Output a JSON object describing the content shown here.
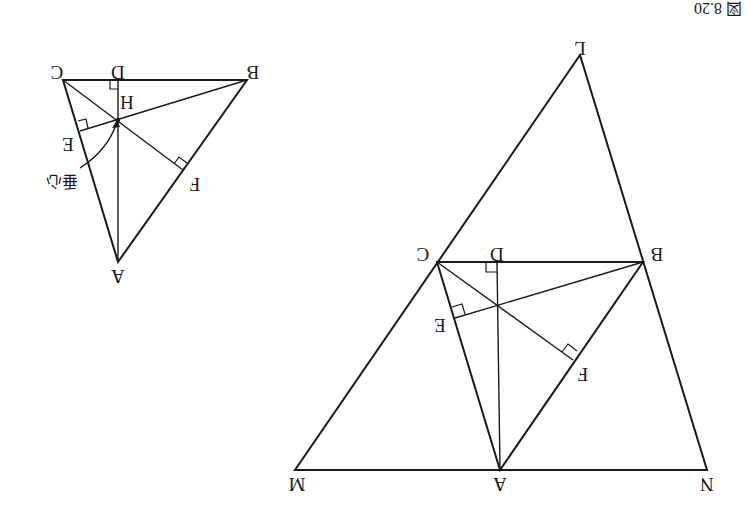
{
  "figure": {
    "caption": "図 8.20",
    "orientation": "rotated 180 degrees",
    "annotation_label": "垂心"
  },
  "large_figure": {
    "outer_triangle": [
      "L",
      "M",
      "N"
    ],
    "inner_triangle": [
      "A",
      "B",
      "C"
    ],
    "altitude_feet": [
      "D",
      "E",
      "F"
    ],
    "labels": {
      "L": "L",
      "M": "M",
      "N": "N",
      "A": "A",
      "B": "B",
      "C": "C",
      "D": "D",
      "E": "E",
      "F": "F"
    },
    "right_angle_marks": [
      "D",
      "E",
      "F"
    ]
  },
  "small_figure": {
    "triangle": [
      "A",
      "B",
      "C"
    ],
    "altitude_feet": [
      "D",
      "E",
      "F"
    ],
    "orthocenter": "H",
    "labels": {
      "A": "A",
      "B": "B",
      "C": "C",
      "D": "D",
      "E": "E",
      "F": "F",
      "H": "H"
    },
    "right_angle_marks": [
      "D",
      "E",
      "F"
    ]
  },
  "colors": {
    "ink": "#1a1a1a",
    "background": "#ffffff"
  }
}
